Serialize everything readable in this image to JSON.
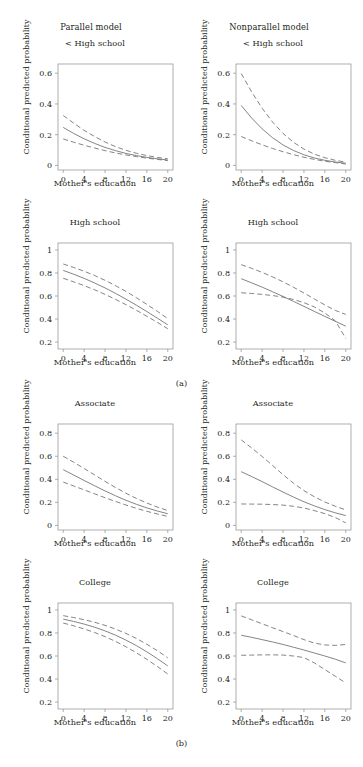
{
  "figure": {
    "columns": [
      {
        "id": "parallel",
        "title": "Parallel model"
      },
      {
        "id": "nonparallel",
        "title": "Nonparallel model"
      }
    ],
    "sublabels": [
      {
        "id": "a",
        "text": "(a)"
      },
      {
        "id": "b",
        "text": "(b)"
      }
    ],
    "axis_label_x": "Mother's education",
    "axis_label_y": "Conditional predicted probability",
    "line_color": "#6e6e6e",
    "frame_color": "#8c8c8c",
    "text_color": "#231f20"
  },
  "chart_data": [
    {
      "id": "parallel-lt-high-school",
      "type": "line",
      "title": "< High school",
      "column": "Parallel model",
      "group": "(a)",
      "xlabel": "Mother's education",
      "ylabel": "Conditional predicted probability",
      "xlim": [
        -1,
        21
      ],
      "ylim": [
        -0.03,
        0.66
      ],
      "xticks": [
        0,
        4,
        8,
        12,
        16,
        20
      ],
      "yticks": [
        0,
        0.2,
        0.4,
        0.6
      ],
      "ytick_labels": [
        "0",
        "0.2",
        "0.4",
        "0.6"
      ],
      "grid": false,
      "legend": "none",
      "x": [
        0,
        2,
        4,
        6,
        8,
        10,
        12,
        14,
        16,
        18,
        20
      ],
      "series": [
        {
          "name": "upper CI",
          "style": "dashed",
          "values": [
            0.325,
            0.275,
            0.228,
            0.188,
            0.152,
            0.122,
            0.098,
            0.079,
            0.064,
            0.052,
            0.043
          ]
        },
        {
          "name": "predicted",
          "style": "solid",
          "values": [
            0.247,
            0.208,
            0.173,
            0.143,
            0.117,
            0.096,
            0.078,
            0.064,
            0.052,
            0.043,
            0.035
          ]
        },
        {
          "name": "lower CI",
          "style": "dashed",
          "values": [
            0.172,
            0.151,
            0.131,
            0.113,
            0.096,
            0.081,
            0.068,
            0.057,
            0.047,
            0.039,
            0.031
          ]
        }
      ]
    },
    {
      "id": "nonparallel-lt-high-school",
      "type": "line",
      "title": "< High school",
      "column": "Nonparallel model",
      "group": "(a)",
      "xlabel": "Mother's education",
      "ylabel": "Conditional predicted probability",
      "xlim": [
        -1,
        21
      ],
      "ylim": [
        -0.03,
        0.66
      ],
      "xticks": [
        0,
        4,
        8,
        12,
        16,
        20
      ],
      "yticks": [
        0,
        0.2,
        0.4,
        0.6
      ],
      "ytick_labels": [
        "0",
        "0.2",
        "0.4",
        "0.6"
      ],
      "grid": false,
      "legend": "none",
      "x": [
        0,
        2,
        4,
        6,
        8,
        10,
        12,
        14,
        16,
        18,
        20
      ],
      "series": [
        {
          "name": "upper CI",
          "style": "dashed",
          "values": [
            0.598,
            0.478,
            0.372,
            0.282,
            0.208,
            0.15,
            0.106,
            0.073,
            0.05,
            0.033,
            0.021
          ]
        },
        {
          "name": "predicted",
          "style": "solid",
          "values": [
            0.39,
            0.308,
            0.238,
            0.18,
            0.133,
            0.097,
            0.069,
            0.048,
            0.033,
            0.022,
            0.014
          ]
        },
        {
          "name": "lower CI",
          "style": "dashed",
          "values": [
            0.188,
            0.16,
            0.134,
            0.11,
            0.089,
            0.07,
            0.053,
            0.039,
            0.027,
            0.018,
            0.009
          ]
        }
      ]
    },
    {
      "id": "parallel-high-school",
      "type": "line",
      "title": "High school",
      "column": "Parallel model",
      "group": "(a)",
      "xlabel": "Mother's education",
      "ylabel": "Conditional predicted probability",
      "xlim": [
        -1,
        21
      ],
      "ylim": [
        0.14,
        1.06
      ],
      "xticks": [
        0,
        4,
        8,
        12,
        16,
        20
      ],
      "yticks": [
        0.2,
        0.4,
        0.6,
        0.8,
        1
      ],
      "ytick_labels": [
        "0.2",
        "0.4",
        "0.6",
        "0.8",
        "1"
      ],
      "grid": false,
      "legend": "none",
      "x": [
        0,
        2,
        4,
        6,
        8,
        10,
        12,
        14,
        16,
        18,
        20
      ],
      "series": [
        {
          "name": "upper CI",
          "style": "dashed",
          "values": [
            0.878,
            0.848,
            0.815,
            0.778,
            0.736,
            0.69,
            0.64,
            0.585,
            0.527,
            0.467,
            0.404
          ]
        },
        {
          "name": "predicted",
          "style": "solid",
          "values": [
            0.822,
            0.789,
            0.753,
            0.713,
            0.67,
            0.623,
            0.573,
            0.52,
            0.465,
            0.408,
            0.35
          ]
        },
        {
          "name": "lower CI",
          "style": "dashed",
          "values": [
            0.754,
            0.723,
            0.69,
            0.654,
            0.614,
            0.571,
            0.525,
            0.476,
            0.424,
            0.371,
            0.316
          ]
        }
      ]
    },
    {
      "id": "nonparallel-high-school",
      "type": "line",
      "title": "High school",
      "column": "Nonparallel model",
      "group": "(a)",
      "xlabel": "Mother's education",
      "ylabel": "Conditional predicted probability",
      "xlim": [
        -1,
        21
      ],
      "ylim": [
        0.14,
        1.06
      ],
      "xticks": [
        0,
        4,
        8,
        12,
        16,
        20
      ],
      "yticks": [
        0.2,
        0.4,
        0.6,
        0.8,
        1
      ],
      "ytick_labels": [
        "0.2",
        "0.4",
        "0.6",
        "0.8",
        "1"
      ],
      "grid": false,
      "legend": "none",
      "x": [
        0,
        2,
        4,
        6,
        8,
        10,
        12,
        14,
        16,
        18,
        20
      ],
      "series": [
        {
          "name": "upper CI",
          "style": "dashed",
          "values": [
            0.872,
            0.84,
            0.805,
            0.766,
            0.723,
            0.676,
            0.626,
            0.574,
            0.522,
            0.475,
            0.44
          ]
        },
        {
          "name": "predicted",
          "style": "solid",
          "values": [
            0.75,
            0.714,
            0.677,
            0.637,
            0.596,
            0.553,
            0.51,
            0.466,
            0.423,
            0.38,
            0.338
          ]
        },
        {
          "name": "lower CI",
          "style": "dashed",
          "values": [
            0.628,
            0.622,
            0.614,
            0.604,
            0.59,
            0.57,
            0.542,
            0.505,
            0.452,
            0.385,
            0.232
          ]
        }
      ]
    },
    {
      "id": "parallel-associate",
      "type": "line",
      "title": "Associate",
      "column": "Parallel model",
      "group": "(b)",
      "xlabel": "Mother's education",
      "ylabel": "Conditional predicted probability",
      "xlim": [
        -1,
        21
      ],
      "ylim": [
        -0.04,
        0.88
      ],
      "xticks": [
        0,
        4,
        8,
        12,
        16,
        20
      ],
      "yticks": [
        0,
        0.2,
        0.4,
        0.6,
        0.8
      ],
      "ytick_labels": [
        "0",
        "0.2",
        "0.4",
        "0.6",
        "0.8"
      ],
      "grid": false,
      "legend": "none",
      "x": [
        0,
        2,
        4,
        6,
        8,
        10,
        12,
        14,
        16,
        18,
        20
      ],
      "series": [
        {
          "name": "upper CI",
          "style": "dashed",
          "values": [
            0.6,
            0.548,
            0.494,
            0.438,
            0.382,
            0.329,
            0.279,
            0.234,
            0.194,
            0.159,
            0.129
          ]
        },
        {
          "name": "predicted",
          "style": "solid",
          "values": [
            0.484,
            0.437,
            0.39,
            0.344,
            0.299,
            0.257,
            0.218,
            0.183,
            0.152,
            0.125,
            0.101
          ]
        },
        {
          "name": "lower CI",
          "style": "dashed",
          "values": [
            0.376,
            0.342,
            0.308,
            0.274,
            0.24,
            0.208,
            0.177,
            0.148,
            0.122,
            0.099,
            0.078
          ]
        }
      ]
    },
    {
      "id": "nonparallel-associate",
      "type": "line",
      "title": "Associate",
      "column": "Nonparallel model",
      "group": "(b)",
      "xlabel": "Mother's education",
      "ylabel": "Conditional predicted probability",
      "xlim": [
        -1,
        21
      ],
      "ylim": [
        -0.04,
        0.88
      ],
      "xticks": [
        0,
        4,
        8,
        12,
        16,
        20
      ],
      "yticks": [
        0,
        0.2,
        0.4,
        0.6,
        0.8
      ],
      "ytick_labels": [
        "0",
        "0.2",
        "0.4",
        "0.6",
        "0.8"
      ],
      "grid": false,
      "legend": "none",
      "x": [
        0,
        2,
        4,
        6,
        8,
        10,
        12,
        14,
        16,
        18,
        20
      ],
      "series": [
        {
          "name": "upper CI",
          "style": "dashed",
          "values": [
            0.742,
            0.672,
            0.598,
            0.52,
            0.44,
            0.366,
            0.302,
            0.248,
            0.203,
            0.166,
            0.134
          ]
        },
        {
          "name": "predicted",
          "style": "solid",
          "values": [
            0.466,
            0.424,
            0.38,
            0.334,
            0.289,
            0.246,
            0.205,
            0.169,
            0.137,
            0.109,
            0.085
          ]
        },
        {
          "name": "lower CI",
          "style": "dashed",
          "values": [
            0.186,
            0.185,
            0.184,
            0.181,
            0.176,
            0.166,
            0.151,
            0.128,
            0.102,
            0.068,
            0.022
          ]
        }
      ]
    },
    {
      "id": "parallel-college",
      "type": "line",
      "title": "College",
      "column": "Parallel model",
      "group": "(b)",
      "xlabel": "Mother's education",
      "ylabel": "Conditional predicted probability",
      "xlim": [
        -1,
        21
      ],
      "ylim": [
        0.14,
        1.06
      ],
      "xticks": [
        0,
        4,
        8,
        12,
        16,
        20
      ],
      "yticks": [
        0.2,
        0.4,
        0.6,
        0.8,
        1
      ],
      "ytick_labels": [
        "0.2",
        "0.4",
        "0.6",
        "0.8",
        "1"
      ],
      "grid": false,
      "legend": "none",
      "x": [
        0,
        2,
        4,
        6,
        8,
        10,
        12,
        14,
        16,
        18,
        20
      ],
      "series": [
        {
          "name": "upper CI",
          "style": "dashed",
          "values": [
            0.95,
            0.934,
            0.915,
            0.893,
            0.866,
            0.834,
            0.796,
            0.752,
            0.702,
            0.646,
            0.584
          ]
        },
        {
          "name": "predicted",
          "style": "solid",
          "values": [
            0.92,
            0.9,
            0.877,
            0.85,
            0.818,
            0.781,
            0.738,
            0.69,
            0.636,
            0.577,
            0.514
          ]
        },
        {
          "name": "lower CI",
          "style": "dashed",
          "values": [
            0.886,
            0.862,
            0.835,
            0.804,
            0.768,
            0.727,
            0.68,
            0.628,
            0.571,
            0.509,
            0.444
          ]
        }
      ]
    },
    {
      "id": "nonparallel-college",
      "type": "line",
      "title": "College",
      "column": "Nonparallel model",
      "group": "(b)",
      "xlabel": "Mother's education",
      "ylabel": "Conditional predicted probability",
      "xlim": [
        -1,
        21
      ],
      "ylim": [
        0.14,
        1.06
      ],
      "xticks": [
        0,
        4,
        8,
        12,
        16,
        20
      ],
      "yticks": [
        0.2,
        0.4,
        0.6,
        0.8,
        1
      ],
      "ytick_labels": [
        "0.2",
        "0.4",
        "0.6",
        "0.8",
        "1"
      ],
      "grid": false,
      "legend": "none",
      "x": [
        0,
        2,
        4,
        6,
        8,
        10,
        12,
        14,
        16,
        18,
        20
      ],
      "series": [
        {
          "name": "upper CI",
          "style": "dashed",
          "values": [
            0.948,
            0.914,
            0.88,
            0.845,
            0.812,
            0.778,
            0.742,
            0.712,
            0.696,
            0.692,
            0.7
          ]
        },
        {
          "name": "predicted",
          "style": "solid",
          "values": [
            0.78,
            0.762,
            0.742,
            0.722,
            0.7,
            0.676,
            0.652,
            0.626,
            0.6,
            0.572,
            0.54
          ]
        },
        {
          "name": "lower CI",
          "style": "dashed",
          "values": [
            0.606,
            0.608,
            0.61,
            0.61,
            0.608,
            0.6,
            0.586,
            0.54,
            0.482,
            0.424,
            0.366
          ]
        }
      ]
    }
  ]
}
